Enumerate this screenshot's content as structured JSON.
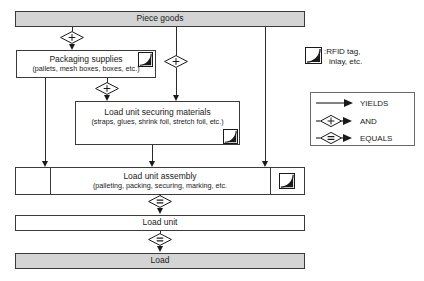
{
  "diagram": {
    "nodes": {
      "piece_goods": {
        "label": "Piece goods",
        "fill": "#d4d4d4"
      },
      "packaging_supplies": {
        "label": "Packaging supplies",
        "detail": "(pallets, mesh boxes, boxes, etc.)",
        "fill": "#ffffff"
      },
      "securing_materials": {
        "label": "Load unit securing materials",
        "detail": "(straps, glues, shrink foil, stretch foil, etc.)",
        "fill": "#ffffff"
      },
      "load_unit_assembly": {
        "label": "Load unit assembly",
        "detail": "(palleting, packing, securing, marking, etc.",
        "fill": "#ffffff"
      },
      "load_unit": {
        "label": "Load unit",
        "fill": "#ffffff"
      },
      "load": {
        "label": "Load",
        "fill": "#d4d4d4"
      }
    },
    "connector_symbols": {
      "and": "+",
      "equals": "=",
      "yields": ""
    }
  },
  "legend": {
    "rfid_key": {
      "icon": "rfid-tag-icon",
      "line1": ":RFID tag,",
      "line2": "inlay, etc."
    },
    "rows": [
      {
        "symbol": "plain-arrow",
        "label": "YIELDS"
      },
      {
        "symbol": "and-diamond-arrow",
        "label": "AND",
        "glyph": "+"
      },
      {
        "symbol": "equals-diamond-arrow",
        "label": "EQUALS",
        "glyph": "="
      }
    ]
  },
  "colors": {
    "shaded_fill": "#d4d4d4",
    "stroke": "#3a3a3a",
    "text": "#1a1a1a"
  }
}
